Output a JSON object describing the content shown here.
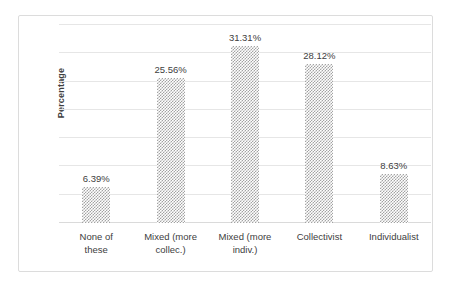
{
  "chart_data": {
    "type": "bar",
    "title": "",
    "xlabel": "",
    "ylabel": "Percentage",
    "categories": [
      "None of these",
      "Mixed (more collec.)",
      "Mixed (more indiv.)",
      "Collectivist",
      "Individualist"
    ],
    "category_lines": [
      [
        "None of",
        "these"
      ],
      [
        "Mixed (more",
        "collec.)"
      ],
      [
        "Mixed (more",
        "indiv.)"
      ],
      [
        "Collectivist",
        ""
      ],
      [
        "Individualist",
        ""
      ]
    ],
    "values": [
      6.39,
      25.56,
      31.31,
      28.12,
      8.63
    ],
    "data_labels": [
      "6.39%",
      "25.56%",
      "31.31%",
      "28.12%",
      "8.63%"
    ],
    "ylim": [
      0,
      35
    ],
    "y_gridline_values": [
      5,
      10,
      15,
      20,
      25,
      30,
      35
    ],
    "y_tick_labels_visible": false,
    "grid": true,
    "legend": "none",
    "bar_fill": "#a3a3a3",
    "bar_pattern": "checkered-dither",
    "gridline_color": "#e6e6e6",
    "border_color": "#dcdcdc",
    "text_color": "#404040"
  }
}
